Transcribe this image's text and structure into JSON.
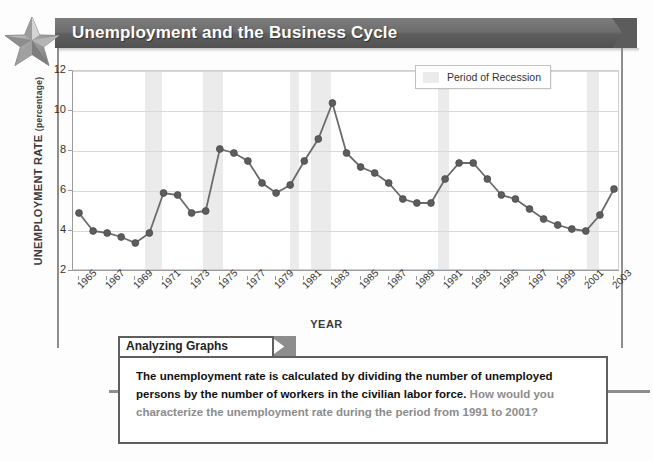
{
  "header": {
    "title": "Unemployment and the Business Cycle",
    "star_icon": "star-icon"
  },
  "chart_data": {
    "type": "line",
    "title": "Unemployment and the Business Cycle",
    "xlabel": "YEAR",
    "ylabel": "UNEMPLOYMENT RATE",
    "ylabel_unit": "(percentage)",
    "ylim": [
      2,
      12
    ],
    "yticks": [
      2,
      4,
      6,
      8,
      10,
      12
    ],
    "xlim": [
      1965,
      2003
    ],
    "xticks": [
      1965,
      1967,
      1969,
      1971,
      1973,
      1975,
      1977,
      1979,
      1981,
      1983,
      1985,
      1987,
      1989,
      1991,
      1993,
      1995,
      1997,
      1999,
      2001,
      2003
    ],
    "grid": true,
    "legend_position": "top-right",
    "legend": [
      {
        "label": "Period of Recession",
        "color": "#ebebeb"
      }
    ],
    "series_color": "#6b6b6b",
    "marker_color": "#5d5d5d",
    "x": [
      1965,
      1966,
      1967,
      1968,
      1969,
      1970,
      1971,
      1972,
      1973,
      1974,
      1975,
      1976,
      1977,
      1978,
      1979,
      1980,
      1981,
      1982,
      1983,
      1984,
      1985,
      1986,
      1987,
      1988,
      1989,
      1990,
      1991,
      1992,
      1993,
      1994,
      1995,
      1996,
      1997,
      1998,
      1999,
      2000,
      2001,
      2002,
      2003
    ],
    "values": [
      4.9,
      4.0,
      3.9,
      3.7,
      3.4,
      3.9,
      5.9,
      5.8,
      4.9,
      5.0,
      8.1,
      7.9,
      7.5,
      6.4,
      5.9,
      6.3,
      7.5,
      8.6,
      10.4,
      7.9,
      7.2,
      6.9,
      6.4,
      5.6,
      5.4,
      5.4,
      6.6,
      7.4,
      7.4,
      6.6,
      5.8,
      5.6,
      5.1,
      4.6,
      4.3,
      4.1,
      4.0,
      4.8,
      6.1
    ],
    "recessions": [
      {
        "start": 1969.7,
        "end": 1970.9
      },
      {
        "start": 1973.8,
        "end": 1975.2
      },
      {
        "start": 1980.0,
        "end": 1980.6
      },
      {
        "start": 1981.5,
        "end": 1982.9
      },
      {
        "start": 1990.5,
        "end": 1991.3
      },
      {
        "start": 2001.1,
        "end": 2001.9
      }
    ]
  },
  "analyzing_graphs": {
    "tab_label": "Analyzing Graphs",
    "statement": "The unemployment rate is calculated by dividing the number of unemployed persons by the number of workers in the civilian labor force.",
    "question": "How would you characterize the unemployment rate during the period from 1991 to 2001?"
  }
}
